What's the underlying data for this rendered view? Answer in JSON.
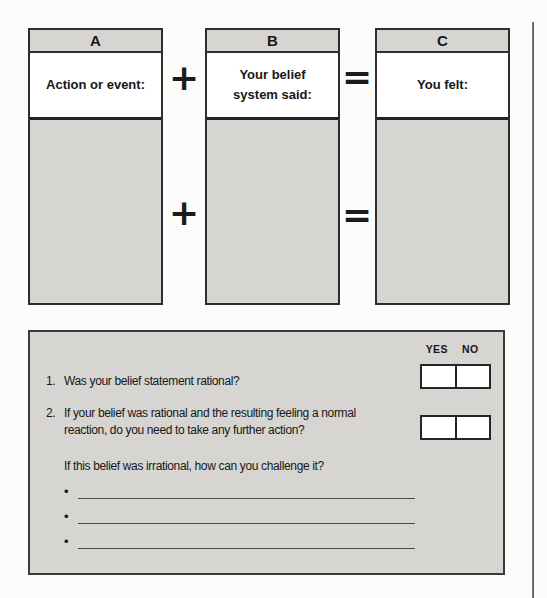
{
  "diagram": {
    "columns": [
      {
        "header": "A",
        "label": "Action or event:"
      },
      {
        "header": "B",
        "label": "Your belief system said:"
      },
      {
        "header": "C",
        "label": "You felt:"
      }
    ],
    "plus": "+",
    "equals": "="
  },
  "panel": {
    "yes": "YES",
    "no": "NO",
    "q1_number": "1.",
    "q1_text": "Was your belief statement rational?",
    "q2_number": "2.",
    "q2_lines": [
      "If your belief was rational and the resulting feeling a normal",
      "reaction, do you need to take any further action?"
    ],
    "challenge_text": "If this belief was irrational, how can you challenge it?",
    "bullet": "•"
  },
  "colors": {
    "panel_gray": "#d6d5d2",
    "border_dark": "#2e2e2e",
    "text": "#171717",
    "page_bg": "#fcfcfa"
  }
}
